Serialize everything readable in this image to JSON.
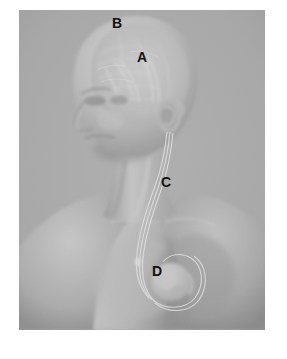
{
  "figure": {
    "kind": "medical-illustration",
    "background_color": "#ffffff",
    "plate_color": "#a9a9a9",
    "plate": {
      "x": 19,
      "y": 10,
      "width": 246,
      "height": 320
    }
  },
  "annotations": [
    {
      "id": "a",
      "label": "A",
      "target": "brain",
      "x": 118,
      "y": 40
    },
    {
      "id": "b",
      "label": "B",
      "target": "top-of-skull",
      "x": 93,
      "y": 6
    },
    {
      "id": "c",
      "label": "C",
      "target": "lead-wire-in-neck",
      "x": 142,
      "y": 165
    },
    {
      "id": "d",
      "label": "D",
      "target": "pulse-generator-in-chest",
      "x": 133,
      "y": 254
    }
  ],
  "caption": {
    "text": ""
  },
  "palette": {
    "background": "#a9a9a9",
    "skin_light": "#c9c9c9",
    "skin_mid": "#b0b0b0",
    "skin_shadow": "#8d8d8d",
    "skin_deep_shadow": "#7a7a7a",
    "brain_tint": "#c2c2c2",
    "vessel": "#d8d8d8",
    "lead_wire": "#d2d2d2",
    "device_body": "#cfcfcf",
    "label_text": "#111111"
  }
}
